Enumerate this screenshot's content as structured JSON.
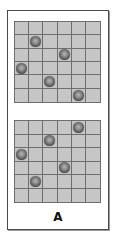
{
  "figure": {
    "label": "A",
    "grid_size": {
      "rows": 6,
      "cols": 6
    },
    "colors": {
      "cell": "#c6c6c6",
      "grid_line": "#6e6e6e",
      "border": "#4a4a4a",
      "ball_dark": "#2a2a2a",
      "ball_light": "#b5b5b5"
    },
    "panels": [
      {
        "name": "top",
        "balls": [
          {
            "row": 1,
            "col": 1
          },
          {
            "row": 2,
            "col": 3
          },
          {
            "row": 3,
            "col": 0
          },
          {
            "row": 4,
            "col": 2
          },
          {
            "row": 5,
            "col": 4
          }
        ]
      },
      {
        "name": "bottom",
        "balls": [
          {
            "row": 0,
            "col": 4
          },
          {
            "row": 1,
            "col": 2
          },
          {
            "row": 2,
            "col": 0
          },
          {
            "row": 3,
            "col": 3
          },
          {
            "row": 4,
            "col": 1
          }
        ]
      }
    ]
  }
}
